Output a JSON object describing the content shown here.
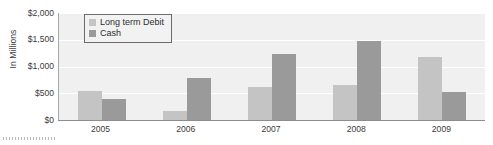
{
  "chart_data": {
    "type": "bar",
    "title": "",
    "subtitle": "",
    "xlabel": "",
    "ylabel": "In Millions",
    "categories": [
      "2005",
      "2006",
      "2007",
      "2008",
      "2009"
    ],
    "series": [
      {
        "name": "Long term Debit",
        "color": "#c4c4c4",
        "values": [
          550,
          160,
          610,
          650,
          1180
        ]
      },
      {
        "name": "Cash",
        "color": "#9a9a9a",
        "values": [
          390,
          790,
          1230,
          1470,
          520
        ]
      }
    ],
    "ylim": [
      0,
      2000
    ],
    "y_ticks": [
      0,
      500,
      1000,
      1500,
      2000
    ],
    "y_tick_labels": [
      "$0",
      "$500",
      "$1,000",
      "$1,500",
      "$2,000"
    ],
    "grid": true,
    "grid_color": "#ffffff",
    "plot_background": "#f0f0f0",
    "legend_position": "top-left",
    "legend_entries": [
      "Long term Debit",
      "Cash"
    ]
  },
  "axis": {
    "y_title": "In Millions"
  },
  "decorations": {
    "bottom_dotted_marker": "dotted-line"
  }
}
